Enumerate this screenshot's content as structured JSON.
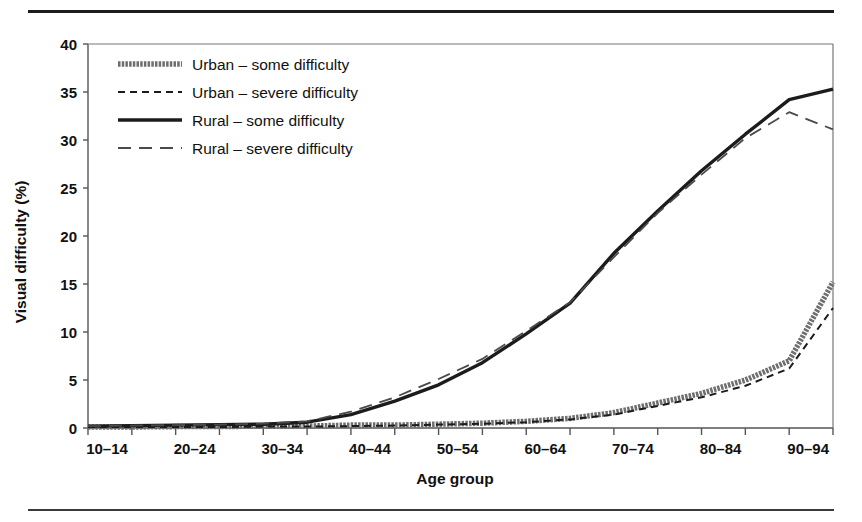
{
  "figure": {
    "rule_top": "horizontal-rule",
    "rule_bottom": "horizontal-rule"
  },
  "chart_data": {
    "type": "line",
    "title": "",
    "xlabel": "Age group",
    "ylabel": "Visual difficulty (%)",
    "ylim": [
      0,
      40
    ],
    "yticks": [
      0,
      5,
      10,
      15,
      20,
      25,
      30,
      35,
      40
    ],
    "ytick_labels": [
      "0",
      "5",
      "10",
      "15",
      "20",
      "25",
      "30",
      "35",
      "40"
    ],
    "grid": false,
    "legend_position": "upper-left",
    "categories": [
      "10–14",
      "15–19",
      "20–24",
      "25–29",
      "30–34",
      "35–39",
      "40–44",
      "45–49",
      "50–54",
      "55–59",
      "60–64",
      "65–69",
      "70–74",
      "75–79",
      "80–84",
      "85–89",
      "90–94",
      "95+"
    ],
    "xtick_labels": [
      "10–14",
      "",
      "20–24",
      "",
      "30–34",
      "",
      "40–44",
      "",
      "50–54",
      "",
      "60–64",
      "",
      "70–74",
      "",
      "80–84",
      "",
      "90–94",
      ""
    ],
    "series": [
      {
        "name": "Urban – some difficulty",
        "style": "thick-textured-gray",
        "color": "#6e6e6e",
        "values": [
          0.1,
          0.1,
          0.15,
          0.15,
          0.2,
          0.2,
          0.3,
          0.3,
          0.4,
          0.5,
          0.7,
          1.0,
          1.6,
          2.6,
          3.6,
          5.0,
          7.0,
          15.2
        ]
      },
      {
        "name": "Urban – severe difficulty",
        "style": "short-dash-black",
        "color": "#1c1c1c",
        "values": [
          0.1,
          0.1,
          0.1,
          0.1,
          0.15,
          0.15,
          0.2,
          0.25,
          0.35,
          0.45,
          0.6,
          0.9,
          1.4,
          2.3,
          3.2,
          4.4,
          6.2,
          12.5
        ]
      },
      {
        "name": "Rural – some difficulty",
        "style": "thick-solid-black",
        "color": "#1c1c1c",
        "values": [
          0.2,
          0.25,
          0.3,
          0.35,
          0.4,
          0.6,
          1.4,
          2.8,
          4.5,
          6.8,
          9.8,
          13.0,
          18.2,
          22.6,
          26.8,
          30.6,
          34.2,
          35.3
        ]
      },
      {
        "name": "Rural – severe difficulty",
        "style": "long-dash-gray",
        "color": "#4a4a4a",
        "values": [
          0.2,
          0.25,
          0.3,
          0.35,
          0.45,
          0.7,
          1.7,
          3.2,
          5.1,
          7.2,
          10.1,
          13.1,
          17.8,
          22.4,
          26.4,
          30.2,
          32.9,
          31.1
        ]
      }
    ],
    "legend": [
      {
        "label": "Urban – some difficulty",
        "style": "thick-textured-gray"
      },
      {
        "label": "Urban – severe difficulty",
        "style": "short-dash-black"
      },
      {
        "label": "Rural – some difficulty",
        "style": "thick-solid-black"
      },
      {
        "label": "Rural – severe difficulty",
        "style": "long-dash-gray"
      }
    ]
  }
}
